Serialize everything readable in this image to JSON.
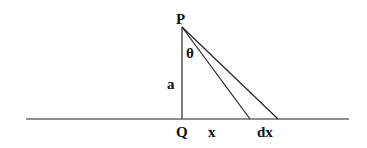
{
  "diagram": {
    "labels": {
      "P": "P",
      "theta": "θ",
      "a": "a",
      "Q": "Q",
      "x": "x",
      "dx": "dx"
    },
    "colors": {
      "line": "#222222",
      "background": "#ffffff"
    }
  }
}
